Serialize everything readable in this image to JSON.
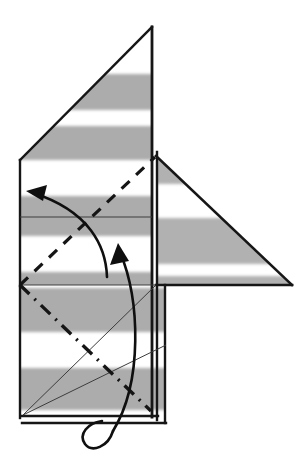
{
  "figure": {
    "kind": "origami-fold-diagram",
    "canvas": {
      "width": 307,
      "height": 460
    },
    "background_color": "#ffffff",
    "line_color": "#1a1a1a",
    "thin_line_color": "#3a3a3a",
    "stripe_color": "#a8a8a8",
    "stripe_color_light": "#bdbdbd",
    "paper_fill": "#ffffff"
  },
  "geometry": {
    "upper_left_panel": {
      "name": "upper-left-panel",
      "points": "20,160 152,27 152,285 20,285",
      "description": "Large left panel with angled top-left edge"
    },
    "right_triangle_flap": {
      "name": "right-triangle-flap",
      "points": "156,156 292,285 156,285",
      "description": "Right-pointing triangular flap"
    },
    "lower_rectangle": {
      "name": "lower-rectangle-panel",
      "points": "20,285 156,285 156,416 20,416",
      "description": "Lower rectangular panel"
    },
    "outer_edge_bottom": {
      "x1": 22,
      "y1": 423,
      "x2": 166,
      "y2": 423
    },
    "outer_edge_right": {
      "x1": 165,
      "y1": 285,
      "x2": 165,
      "y2": 423
    },
    "spine_vertical": {
      "x1": 152,
      "y1": 27,
      "x2": 152,
      "y2": 416
    },
    "spine_vertical_2": {
      "x1": 157,
      "y1": 150,
      "x2": 157,
      "y2": 420
    },
    "left_edge": {
      "x1": 20,
      "y1": 160,
      "x2": 20,
      "y2": 418
    },
    "top_diagonal": {
      "x1": 20,
      "y1": 160,
      "x2": 152,
      "y2": 27
    },
    "crease_horizontal_mid": {
      "x1": 20,
      "y1": 217,
      "x2": 152,
      "y2": 217
    },
    "crease_horizontal_low": {
      "x1": 20,
      "y1": 285,
      "x2": 156,
      "y2": 285
    },
    "thin_diagonal_a": {
      "x1": 23,
      "y1": 415,
      "x2": 155,
      "y2": 286
    },
    "thin_diagonal_b": {
      "x1": 23,
      "y1": 415,
      "x2": 166,
      "y2": 345
    }
  },
  "stripes": [
    {
      "name": "stripe-1",
      "y": 74,
      "height": 36
    },
    {
      "name": "stripe-2",
      "y": 126,
      "height": 34
    },
    {
      "name": "stripe-3",
      "y": 196,
      "height": 40
    },
    {
      "name": "stripe-4",
      "y": 288,
      "height": 44
    },
    {
      "name": "stripe-5",
      "y": 368,
      "height": 42
    }
  ],
  "fold_lines": [
    {
      "name": "valley-fold-dashed",
      "style": "dashed",
      "x1": 20,
      "y1": 285,
      "x2": 155,
      "y2": 157,
      "dasharray": "11 9",
      "width": 3.2,
      "label": "valley fold"
    },
    {
      "name": "mountain-fold-dash-dot",
      "style": "dash-dot",
      "x1": 20,
      "y1": 285,
      "x2": 151,
      "y2": 411,
      "dasharray": "13 7 2 7",
      "width": 3.4,
      "label": "mountain fold"
    }
  ],
  "arrows": [
    {
      "name": "fold-arrow-left",
      "label": "fold left arrow",
      "path": "M 107,276 C 104,248 88,212 32,193",
      "head": "M 32,193 L 48,187 L 44,200 Z",
      "width": 2.6
    },
    {
      "name": "fold-arrow-up",
      "label": "fold up arrow",
      "path": "M 119,248 C 139,300 142,382 112,432",
      "head": "M 119,248 L 112,264 L 128,262 Z",
      "width": 2.6
    },
    {
      "name": "wrap-around-arrow-tail",
      "label": "wrap around tail",
      "path": "M 112,432 C 104,448 88,452 84,440 C 81,430 92,424 104,424",
      "width": 2.6
    }
  ],
  "annotations": {
    "caption": "",
    "step_number": ""
  }
}
